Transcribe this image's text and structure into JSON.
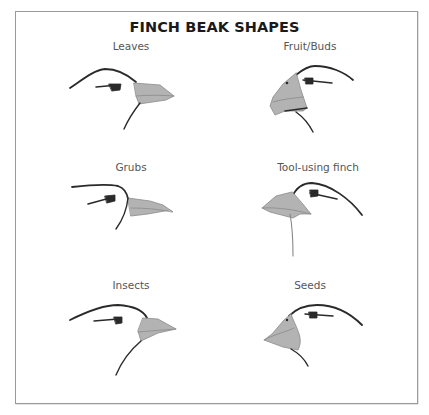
{
  "title": "FINCH BEAK SHAPES",
  "colors": {
    "beak_fill": "#b3b3b3",
    "outline": "#2a2a2a",
    "frame": "#9a9a9a",
    "label": "#555555"
  },
  "panels": [
    {
      "label": "Leaves",
      "diet": "leaves",
      "beak_shape": "short broad pointed"
    },
    {
      "label": "Fruit/Buds",
      "diet": "fruit-buds",
      "beak_shape": "deep parrot-like hooked"
    },
    {
      "label": "Grubs",
      "diet": "grubs",
      "beak_shape": "long slender probing"
    },
    {
      "label": "Tool-using finch",
      "diet": "tool-using",
      "beak_shape": "strong straight wedge"
    },
    {
      "label": "Insects",
      "diet": "insects",
      "beak_shape": "short pointed"
    },
    {
      "label": "Seeds",
      "diet": "seeds",
      "beak_shape": "large deep crushing"
    }
  ]
}
